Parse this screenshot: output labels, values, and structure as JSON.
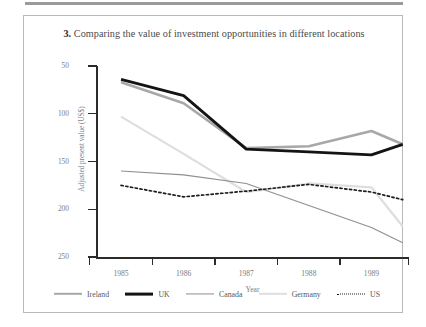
{
  "figure": {
    "number": "3.",
    "title": "Comparing the value of investment opportunities in different locations"
  },
  "axes": {
    "y_label": "Adjusted present value (US$)",
    "x_label": "Year",
    "y_ticks": [
      "250",
      "200",
      "150",
      "100",
      "50"
    ],
    "x_ticks": [
      "1985",
      "1986",
      "1987",
      "1988",
      "1989"
    ]
  },
  "legend": {
    "items": [
      {
        "label": "Ireland",
        "color": "#a8a8a8",
        "style": "thick"
      },
      {
        "label": "UK",
        "color": "#141414",
        "style": "thick"
      },
      {
        "label": "Canada",
        "color": "#8f8f8f",
        "style": "thin"
      },
      {
        "label": "Germany",
        "color": "#dedede",
        "style": "thin"
      },
      {
        "label": "US",
        "color": "#1c1c1c",
        "style": "dotted"
      }
    ]
  },
  "chart_data": {
    "type": "line",
    "title": "3. Comparing the value of investment opportunities in different locations",
    "xlabel": "Year",
    "ylabel": "Adjusted present value (US$)",
    "x": [
      1985,
      1986,
      1987,
      1988,
      1989,
      1989.5
    ],
    "xlim": [
      1984.6,
      1989.6
    ],
    "ylim": [
      50,
      250
    ],
    "yticks": [
      50,
      100,
      150,
      200,
      250
    ],
    "xticks": [
      1985,
      1986,
      1987,
      1988,
      1989
    ],
    "grid": false,
    "legend_position": "bottom",
    "series": [
      {
        "name": "Ireland",
        "color": "#a8a8a8",
        "width": 2.6,
        "dash": "none",
        "values": [
          233,
          211,
          164,
          166,
          182,
          168
        ]
      },
      {
        "name": "UK",
        "color": "#141414",
        "width": 2.8,
        "dash": "none",
        "values": [
          236,
          219,
          163,
          160,
          157,
          168
        ]
      },
      {
        "name": "Canada",
        "color": "#8f8f8f",
        "width": 1.1,
        "dash": "none",
        "values": [
          140,
          136,
          127,
          104,
          81,
          65
        ]
      },
      {
        "name": "Germany",
        "color": "#dedede",
        "width": 2.2,
        "dash": "none",
        "values": [
          197,
          158,
          118,
          127,
          123,
          82
        ]
      },
      {
        "name": "US",
        "color": "#1c1c1c",
        "width": 1.7,
        "dash": "2.2 2.6",
        "values": [
          125,
          113,
          119,
          126,
          118,
          110
        ]
      }
    ]
  }
}
